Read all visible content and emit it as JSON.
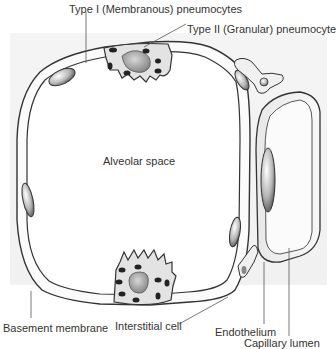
{
  "diagram": {
    "labels": {
      "type1": "Type I (Membranous)  pneumocytes",
      "type2": "Type II (Granular) pneumocyte",
      "alveolar_space": "Alveolar space",
      "basement_membrane": "Basement membrane",
      "interstitial_cell": "Interstitial cell",
      "endothelium": "Endothelium",
      "capillary_lumen": "Capillary lumen"
    },
    "colors": {
      "background_panel": "#f2f2f2",
      "outline": "#333333",
      "cell_fill": "#e6e6e6",
      "nucleus_fill": "#9a9a9a",
      "label_text": "#333333"
    }
  }
}
